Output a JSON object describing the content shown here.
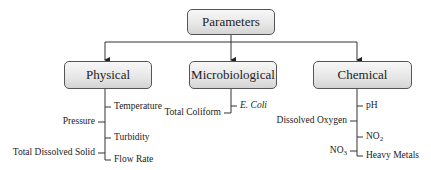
{
  "root": {
    "label": "Parameters"
  },
  "categories": [
    {
      "label": "Physical",
      "right_items": [
        "Temperature",
        "Turbidity",
        "Flow Rate"
      ],
      "left_items": [
        "Pressure",
        "Total Dissolved Solid"
      ]
    },
    {
      "label": "Microbiological",
      "right_items": [
        "E. Coli"
      ],
      "left_items": [
        "Total Coliform"
      ]
    },
    {
      "label": "Chemical",
      "right_items": [
        "pH",
        "NO2",
        "Heavy Metals"
      ],
      "left_items": [
        "Dissolved Oxygen",
        "NO3"
      ]
    }
  ],
  "colors": {
    "line": "#333333",
    "box_border": "#555555",
    "box_fill_top": "#f7f7f7",
    "box_fill_bottom": "#d4d4d4"
  }
}
